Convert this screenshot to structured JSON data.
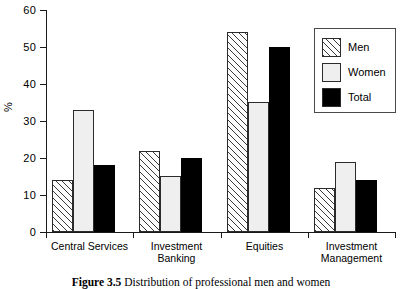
{
  "figure": {
    "caption_label": "Figure 3.5",
    "caption_text": "Distribution of professional men and women"
  },
  "axes": {
    "y_title": "%",
    "y_ticks": [
      "0",
      "10",
      "20",
      "30",
      "40",
      "50",
      "60"
    ]
  },
  "legend": {
    "entries": [
      {
        "label": "Men",
        "swatch": "hatched-swatch",
        "color": "#ffffff"
      },
      {
        "label": "Women",
        "swatch": "light-swatch",
        "color": "#efefef"
      },
      {
        "label": "Total",
        "swatch": "black-swatch",
        "color": "#000000"
      }
    ]
  },
  "categories_display": [
    "Central Services",
    "Investment\nBanking",
    "Equities",
    "Investment\nManagement"
  ],
  "chart_data": {
    "type": "bar",
    "title": "Distribution of professional men and women",
    "xlabel": "",
    "ylabel": "%",
    "ylim": [
      0,
      60
    ],
    "yticks": [
      0,
      10,
      20,
      30,
      40,
      50,
      60
    ],
    "grid": false,
    "legend_position": "upper-right",
    "categories": [
      "Central Services",
      "Investment Banking",
      "Equities",
      "Investment Management"
    ],
    "series": [
      {
        "name": "Men",
        "values": [
          14,
          22,
          54,
          12
        ]
      },
      {
        "name": "Women",
        "values": [
          33,
          15,
          35,
          19
        ]
      },
      {
        "name": "Total",
        "values": [
          18,
          20,
          50,
          14
        ]
      }
    ]
  }
}
